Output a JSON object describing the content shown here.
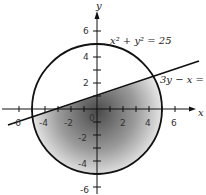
{
  "figure": {
    "axes": {
      "x_label": "x",
      "y_label": "y",
      "x_ticks": [
        "-6",
        "-4",
        "-2",
        "0",
        "2",
        "4",
        "6"
      ],
      "y_ticks": [
        "6",
        "4",
        "2",
        "-2",
        "-4",
        "-6"
      ]
    },
    "curves": {
      "circle_label": "x² + y² = 25",
      "line_label": "3y − x ="
    },
    "colors": {
      "stroke": "#111111",
      "shade_dark": "#555555",
      "shade_light": "#ffffff"
    }
  }
}
